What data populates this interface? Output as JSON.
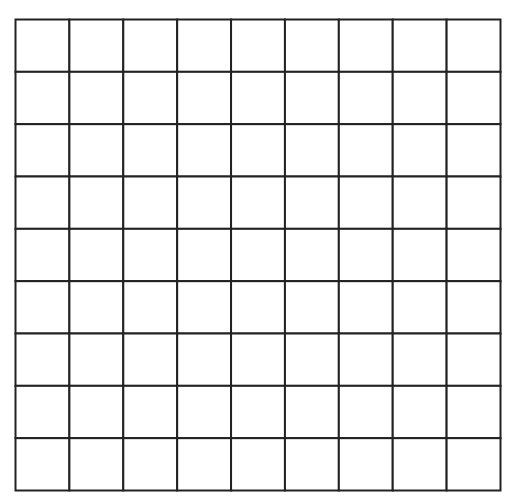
{
  "grid": {
    "rows": 9,
    "columns": 9,
    "line_color": "#222222",
    "cell_fill": "#ffffff",
    "cells_filled": []
  }
}
